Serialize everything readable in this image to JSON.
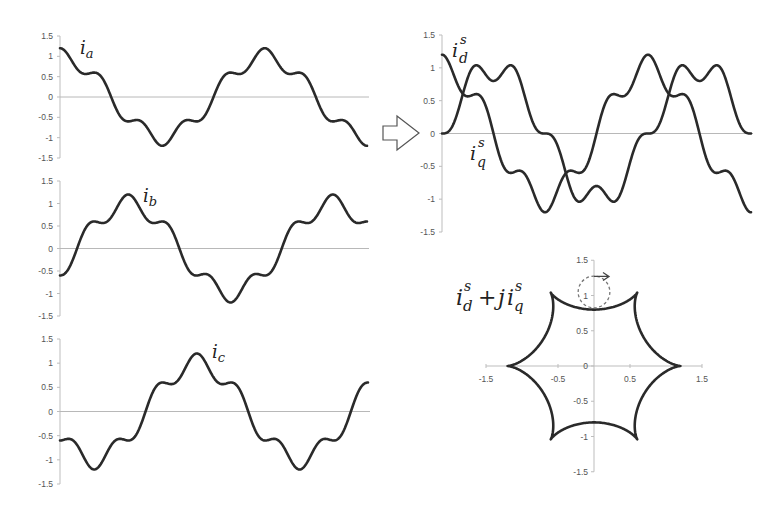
{
  "figure": {
    "arrow_label": "transform-arrow",
    "labels": {
      "ia": {
        "base": "i",
        "sub": "a"
      },
      "ib": {
        "base": "i",
        "sub": "b"
      },
      "ic": {
        "base": "i",
        "sub": "c"
      },
      "id": {
        "base": "i",
        "sub": "d",
        "sup": "s"
      },
      "iq": {
        "base": "i",
        "sub": "q",
        "sup": "s"
      },
      "complex": {
        "part1_base": "i",
        "part1_sub": "d",
        "part1_sup": "s",
        "plus": "+",
        "j": "j",
        "part2_base": "i",
        "part2_sub": "q",
        "part2_sup": "s"
      }
    }
  },
  "chart_data": [
    {
      "type": "line",
      "id": "ia",
      "title": "i_a",
      "xlabel": "",
      "ylabel": "",
      "ylim": [
        -1.5,
        1.5
      ],
      "yticks": [
        "1.5",
        "1",
        "0.5",
        "0",
        "-0.5",
        "-1",
        "-1.5"
      ],
      "grid": false,
      "formula": "cos(t) + 0.2*cos(5t), t in [0, 3pi]",
      "series": [
        {
          "name": "i_a",
          "phase_deg": 0,
          "fundamental": 1.0,
          "harmonic5": 0.2,
          "harmonic5_sequence": "negative"
        }
      ],
      "key_points": {
        "start": 1.2,
        "shoulder": 0.6,
        "peak": 1.2,
        "valley": -1.2,
        "end": -1.2
      }
    },
    {
      "type": "line",
      "id": "ib",
      "title": "i_b",
      "ylim": [
        -1.5,
        1.5
      ],
      "yticks": [
        "1.5",
        "1",
        "0.5",
        "0",
        "-0.5",
        "-1",
        "-1.5"
      ],
      "formula": "cos(t-2pi/3) + 0.2*cos(5(t-2pi/3))",
      "series": [
        {
          "name": "i_b",
          "phase_deg": -120,
          "fundamental": 1.0,
          "harmonic5": 0.2
        }
      ],
      "key_points": {
        "start": -0.6,
        "peak": 1.2,
        "valley": -1.2,
        "end": 0.6
      }
    },
    {
      "type": "line",
      "id": "ic",
      "title": "i_c",
      "ylim": [
        -1.5,
        1.5
      ],
      "yticks": [
        "1.5",
        "1",
        "0.5",
        "0",
        "-0.5",
        "-1",
        "-1.5"
      ],
      "formula": "cos(t+2pi/3) + 0.2*cos(5(t+2pi/3))",
      "series": [
        {
          "name": "i_c",
          "phase_deg": 120,
          "fundamental": 1.0,
          "harmonic5": 0.2
        }
      ],
      "key_points": {
        "start": -0.6,
        "peak": 1.2,
        "valley": -1.2,
        "end": 0.6
      }
    },
    {
      "type": "line",
      "id": "dq",
      "title": "i_d^s, i_q^s",
      "ylim": [
        -1.5,
        1.5
      ],
      "yticks": [
        "1.5",
        "1",
        "0.5",
        "0",
        "-0.5",
        "-1",
        "-1.5"
      ],
      "series": [
        {
          "name": "i_d^s",
          "formula": "cos(t) + 0.2*cos(5t)",
          "start": 1.2,
          "end": -1.2
        },
        {
          "name": "i_q^s",
          "formula": "sin(t) - 0.2*sin(5t)",
          "start": 0.0,
          "max": 1.04,
          "dip": 0.8,
          "end": 0.0
        }
      ]
    },
    {
      "type": "scatter",
      "id": "hexagram",
      "title": "i_d^s + j i_q^s",
      "xlim": [
        -1.5,
        1.5
      ],
      "ylim": [
        -1.5,
        1.5
      ],
      "xticks": [
        "-1.5",
        "-0.5",
        "0.5",
        "1.5"
      ],
      "yticks": [
        "1.5",
        "1",
        "0.5",
        "0",
        "-0.5",
        "-1",
        "-1.5"
      ],
      "curve": "exp(jt) + 0.2*exp(-j5t), t in [0, 2pi]",
      "cusp_radius": 1.2,
      "arc_min_radius": 0.8,
      "annotation": {
        "type": "dashed-circle",
        "center": [
          0,
          1.05
        ],
        "radius": 0.22,
        "arrow": "clockwise"
      }
    }
  ],
  "layout": {
    "panels": {
      "ia": {
        "x0": 60,
        "x1": 367,
        "y_top": 36,
        "y_bot": 158,
        "cycles": 1.5
      },
      "ib": {
        "x0": 60,
        "x1": 367,
        "y_top": 181,
        "y_bot": 316,
        "cycles": 1.5
      },
      "ic": {
        "x0": 60,
        "x1": 368,
        "y_top": 339,
        "y_bot": 484,
        "cycles": 1.5
      },
      "dq": {
        "x0": 442,
        "x1": 751,
        "y_top": 35,
        "y_bot": 232,
        "cycles": 1.5
      },
      "hex": {
        "cx": 594,
        "cy": 366,
        "sx": 72,
        "sy": 70.5
      }
    },
    "stroke": "#2a2a2a"
  }
}
